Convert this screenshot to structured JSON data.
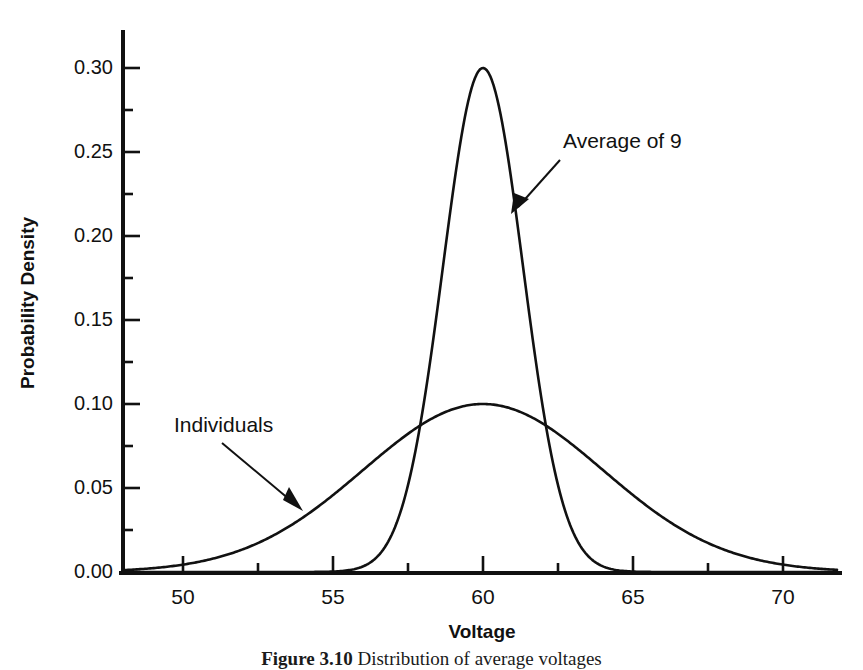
{
  "figure": {
    "caption_label": "Figure 3.10",
    "caption_text": "Distribution of average voltages"
  },
  "chart_data": {
    "type": "line",
    "title": "",
    "xlabel": "Voltage",
    "ylabel": "Probability Density",
    "xlim": [
      48,
      71.8
    ],
    "ylim": [
      0.0,
      0.322
    ],
    "grid": false,
    "legend": "inline-annotations",
    "x_ticks_major": [
      50,
      55,
      60,
      65,
      70
    ],
    "x_tick_labels": [
      "50",
      "55",
      "60",
      "65",
      "70"
    ],
    "x_ticks_minor": [
      52.5,
      57.5,
      62.5,
      67.5
    ],
    "y_ticks_major": [
      0.0,
      0.05,
      0.1,
      0.15,
      0.2,
      0.25,
      0.3
    ],
    "y_tick_labels": [
      "0.00",
      "0.05",
      "0.10",
      "0.15",
      "0.20",
      "0.25",
      "0.30"
    ],
    "y_ticks_minor": [
      0.025,
      0.075,
      0.125,
      0.175,
      0.225,
      0.275
    ],
    "series": [
      {
        "name": "Individuals",
        "distribution": "normal",
        "mean": 60,
        "sigma": 4,
        "peak_value": 0.1,
        "peak_x": 60,
        "annotation": "Individuals",
        "annotation_x": 54,
        "annotation_y": 0.088
      },
      {
        "name": "Average of 9",
        "distribution": "normal",
        "mean": 60,
        "sigma": 1.3333,
        "peak_value": 0.3,
        "peak_x": 60,
        "annotation": "Average of 9",
        "annotation_x": 63.3,
        "annotation_y": 0.258
      }
    ]
  },
  "axis": {
    "x_label": "Voltage",
    "y_label": "Probability Density"
  },
  "annotations": {
    "individuals": "Individuals",
    "average_of_9": "Average of 9"
  },
  "colors": {
    "curve": "#111111",
    "axis": "#111111",
    "background": "#ffffff"
  }
}
